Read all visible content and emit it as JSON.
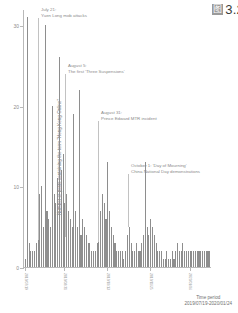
{
  "figure": {
    "caption_marker": "图",
    "caption_text": "3.2"
  },
  "axes": {
    "ylabel": "Number of posts containing the term \"Hong Kong Online\"",
    "xlabel_title": "Time period",
    "xlabel_range": "2019/07/19-2020/01/24",
    "yticks": [
      "0",
      "10",
      "20",
      "30"
    ],
    "ytick_values": [
      0,
      10,
      20,
      30
    ],
    "ylim": [
      0,
      32
    ],
    "xticks": [
      "2019/07/19",
      "2019/08/31",
      "2019/10/13",
      "2019/11/25",
      "2020/01/06"
    ],
    "xtick_positions": [
      0,
      22,
      46,
      70,
      92
    ]
  },
  "annotations": [
    {
      "id": "yuen-long",
      "line1": "July 21:",
      "line2": "Yuen Long mob attacks",
      "text_left": 41,
      "text_top": 7,
      "leader_left": 38,
      "leader_top": 18,
      "leader_height": 222
    },
    {
      "id": "three-suspensions",
      "line1": "August 5:",
      "line2": "The first 'Three Suspensions'",
      "text_left": 68,
      "text_top": 63,
      "leader_left": 65,
      "leader_top": 74,
      "leader_height": 163
    },
    {
      "id": "prince-edward-mtr",
      "line1": "August 31:",
      "line2": "Prince Edward MTR incident",
      "text_left": 101,
      "text_top": 110,
      "leader_left": 98,
      "leader_top": 121,
      "leader_height": 121
    },
    {
      "id": "day-of-mourning",
      "line1": "October 1: 'Day of Mourning'",
      "line2": "China National Day demonstrations",
      "text_left": 131,
      "text_top": 163,
      "leader_left": 128,
      "leader_top": 174,
      "leader_height": 53
    }
  ],
  "colors": {
    "bar": "#8e8e8e",
    "axis": "#b9b9b9",
    "text": "#8a8a8a",
    "leader": "#c2c2c2"
  },
  "chart_data": {
    "type": "bar",
    "title": "",
    "xlabel": "Time period",
    "ylabel": "Number of posts containing the term \"Hong Kong Online\"",
    "ylim": [
      0,
      32
    ],
    "grid": false,
    "legend": "none",
    "categories": [
      "2019/07/19",
      "2019/07/21",
      "2019/07/23",
      "2019/07/25",
      "2019/07/27",
      "2019/07/29",
      "2019/07/31",
      "2019/08/02",
      "2019/08/04",
      "2019/08/05",
      "2019/08/06",
      "2019/08/07",
      "2019/08/08",
      "2019/08/09",
      "2019/08/10",
      "2019/08/11",
      "2019/08/12",
      "2019/08/13",
      "2019/08/14",
      "2019/08/15",
      "2019/08/16",
      "2019/08/17",
      "2019/08/18",
      "2019/08/19",
      "2019/08/20",
      "2019/08/21",
      "2019/08/23",
      "2019/08/25",
      "2019/08/27",
      "2019/08/29",
      "2019/08/31",
      "2019/09/02",
      "2019/09/04",
      "2019/09/06",
      "2019/09/08",
      "2019/09/10",
      "2019/09/12",
      "2019/09/14",
      "2019/09/16",
      "2019/09/18",
      "2019/09/20",
      "2019/09/22",
      "2019/09/24",
      "2019/09/26",
      "2019/09/28",
      "2019/09/30",
      "2019/10/01",
      "2019/10/03",
      "2019/10/05",
      "2019/10/07",
      "2019/10/09",
      "2019/10/11",
      "2019/10/13",
      "2019/10/15",
      "2019/10/17",
      "2019/10/19",
      "2019/10/21",
      "2019/10/23",
      "2019/10/25",
      "2019/10/27",
      "2019/10/29",
      "2019/10/31",
      "2019/11/02",
      "2019/11/04",
      "2019/11/06",
      "2019/11/08",
      "2019/11/10",
      "2019/11/12",
      "2019/11/14",
      "2019/11/16",
      "2019/11/18",
      "2019/11/20",
      "2019/11/22",
      "2019/11/25",
      "2019/11/27",
      "2019/11/29",
      "2019/12/01",
      "2019/12/03",
      "2019/12/05",
      "2019/12/07",
      "2019/12/09",
      "2019/12/11",
      "2019/12/13",
      "2019/12/15",
      "2019/12/17",
      "2019/12/19",
      "2019/12/21",
      "2019/12/23",
      "2019/12/25",
      "2019/12/27",
      "2019/12/29",
      "2019/12/31",
      "2020/01/02",
      "2020/01/04",
      "2020/01/06",
      "2020/01/08",
      "2020/01/10",
      "2020/01/12",
      "2020/01/14",
      "2020/01/16",
      "2020/01/18",
      "2020/01/20",
      "2020/01/22",
      "2020/01/24"
    ],
    "values": [
      1,
      31,
      3,
      2,
      2,
      2,
      3,
      4,
      9,
      10,
      5,
      30,
      7,
      6,
      5,
      20,
      9,
      8,
      11,
      26,
      12,
      14,
      8,
      9,
      7,
      6,
      5,
      19,
      7,
      5,
      22,
      4,
      6,
      5,
      4,
      3,
      3,
      2,
      2,
      2,
      3,
      4,
      7,
      9,
      8,
      6,
      13,
      7,
      5,
      4,
      3,
      2,
      2,
      2,
      2,
      1,
      2,
      4,
      5,
      3,
      2,
      2,
      3,
      2,
      2,
      3,
      4,
      13,
      5,
      4,
      6,
      5,
      4,
      3,
      2,
      2,
      2,
      1,
      1,
      2,
      1,
      1,
      2,
      1,
      2,
      3,
      2,
      2,
      3,
      2,
      2,
      2,
      2,
      2,
      2,
      2,
      2,
      2,
      2,
      2,
      2,
      2,
      2,
      2
    ]
  }
}
